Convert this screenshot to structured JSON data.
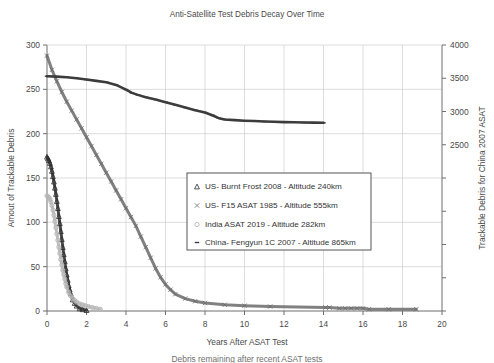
{
  "chart_data": {
    "type": "line",
    "title": "Anti-Satellite Test Debris Decay Over Time",
    "xlabel": "Years After ASAT Test",
    "ylabel": "Amout of Trackable Debris",
    "y2label": "Trackable Debris for China 2007 ASAT",
    "xlim": [
      0,
      20
    ],
    "ylim": [
      0,
      300
    ],
    "y2lim": [
      0,
      4000
    ],
    "xticks": [
      0,
      2,
      4,
      6,
      8,
      10,
      12,
      14,
      16,
      18,
      20
    ],
    "yticks": [
      0,
      50,
      100,
      150,
      200,
      250,
      300
    ],
    "y2ticks": [
      2500,
      3000,
      3500,
      4000
    ],
    "grid": true,
    "legend_position": "center",
    "caption": "Debris remaining after recent ASAT tests",
    "series": [
      {
        "name": "US- Burnt Frost 2008 - Altitude 240km",
        "marker": "triangle",
        "color": "#2b2b2b",
        "axis": "left",
        "x": [
          0.0,
          0.05,
          0.1,
          0.15,
          0.2,
          0.25,
          0.3,
          0.35,
          0.4,
          0.45,
          0.5,
          0.55,
          0.6,
          0.65,
          0.7,
          0.75,
          0.8,
          0.85,
          0.9,
          0.95,
          1.0,
          1.05,
          1.1,
          1.15,
          1.2,
          1.3,
          1.4,
          1.5,
          1.65,
          1.8,
          2.0
        ],
        "y": [
          174,
          172,
          170,
          167,
          163,
          158,
          152,
          146,
          139,
          132,
          124,
          116,
          107,
          99,
          90,
          81,
          72,
          64,
          56,
          48,
          41,
          35,
          29,
          24,
          20,
          13,
          9,
          6,
          3,
          2,
          1
        ]
      },
      {
        "name": "US- F15 ASAT 1985 - Altitude 555km",
        "marker": "x",
        "color": "#6b6b6b",
        "axis": "left",
        "x": [
          0.0,
          0.25,
          0.5,
          0.75,
          1.0,
          1.25,
          1.5,
          1.75,
          2.0,
          2.25,
          2.5,
          2.75,
          3.0,
          3.25,
          3.5,
          3.75,
          4.0,
          4.25,
          4.5,
          4.75,
          5.0,
          5.25,
          5.5,
          5.75,
          6.0,
          6.25,
          6.5,
          7.0,
          7.5,
          8.0,
          9.0,
          10.0,
          11.3,
          14.1,
          14.3,
          14.8,
          15.1,
          15.4,
          15.7,
          16.0,
          16.3,
          17.3,
          18.7
        ],
        "y": [
          288,
          272,
          259,
          247,
          236,
          226,
          216,
          206,
          196,
          186,
          176,
          166,
          156,
          146,
          136,
          126,
          116,
          106,
          96,
          84,
          72,
          60,
          48,
          38,
          30,
          24,
          19,
          14,
          11,
          9,
          7,
          6,
          5,
          4,
          4,
          3,
          3,
          3,
          3,
          3,
          2,
          2,
          2
        ]
      },
      {
        "name": "India ASAT 2019 - Altitude 282km",
        "marker": "circle",
        "color": "#b5b5b5",
        "axis": "left",
        "x": [
          0.0,
          0.05,
          0.1,
          0.15,
          0.2,
          0.25,
          0.3,
          0.35,
          0.4,
          0.45,
          0.5,
          0.55,
          0.6,
          0.65,
          0.7,
          0.75,
          0.8,
          0.85,
          0.9,
          0.95,
          1.0,
          1.1,
          1.2,
          1.3,
          1.4,
          1.5,
          1.65,
          1.8,
          1.95,
          2.1,
          2.3,
          2.5,
          2.7
        ],
        "y": [
          130,
          129,
          128,
          126,
          123,
          119,
          114,
          108,
          101,
          94,
          87,
          80,
          72,
          65,
          58,
          52,
          46,
          41,
          36,
          31,
          27,
          21,
          17,
          14,
          12,
          10,
          8,
          7,
          6,
          5,
          4,
          3,
          2
        ]
      },
      {
        "name": "China- Fengyun 1C 2007 - Altitude 865km",
        "marker": "dash",
        "color": "#3c3c3c",
        "axis": "right",
        "x": [
          0.0,
          0.5,
          1.0,
          1.5,
          2.0,
          2.5,
          3.0,
          3.5,
          4.0,
          4.3,
          4.6,
          5.0,
          5.5,
          6.0,
          6.5,
          7.0,
          7.5,
          8.0,
          8.4,
          8.7,
          9.0,
          9.5,
          10.0,
          10.5,
          11.0,
          11.5,
          12.0,
          12.5,
          13.0,
          13.5,
          14.0
        ],
        "y": [
          3530,
          3525,
          3515,
          3500,
          3480,
          3460,
          3440,
          3400,
          3330,
          3280,
          3250,
          3215,
          3180,
          3140,
          3100,
          3060,
          3020,
          2985,
          2940,
          2900,
          2880,
          2870,
          2862,
          2856,
          2850,
          2845,
          2840,
          2838,
          2835,
          2832,
          2830
        ]
      }
    ]
  },
  "legend": {
    "items": [
      "US- Burnt Frost 2008 - Altitude 240km",
      "US- F15 ASAT 1985 - Altitude 555km",
      "India ASAT 2019 - Altitude 282km",
      "China- Fengyun 1C 2007 - Altitude 865km"
    ]
  }
}
